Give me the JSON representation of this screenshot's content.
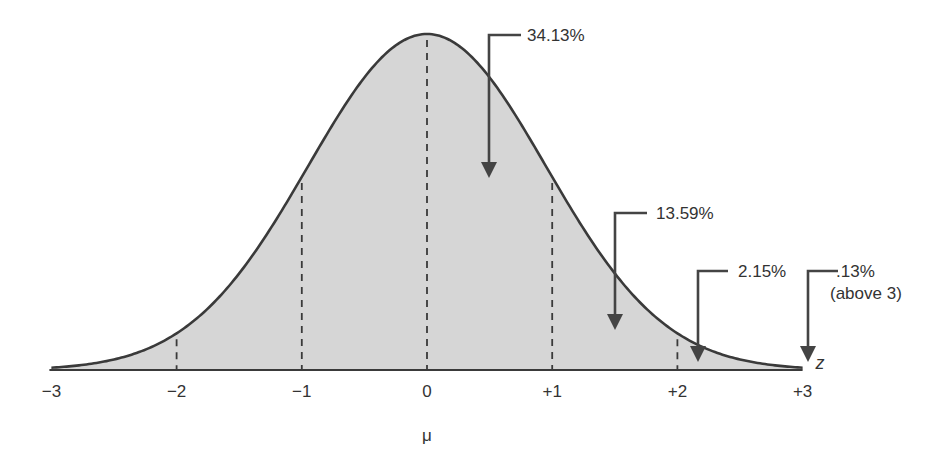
{
  "colors": {
    "fill": "#d6d6d6",
    "line": "#3a3a3a",
    "arrow": "#444444",
    "text": "#333333"
  },
  "chart_data": {
    "type": "area",
    "title": "",
    "xlabel": "z",
    "xlabel_sub": "μ",
    "ylabel": "",
    "xlim": [
      -3,
      3
    ],
    "tick_values": [
      -3,
      -2,
      -1,
      0,
      1,
      2,
      3
    ],
    "tick_labels": [
      "−3",
      "−2",
      "−1",
      "0",
      "+1",
      "+2",
      "+3"
    ],
    "mean_label": "μ",
    "axis_label": "z",
    "dashed_lines_at": [
      -2,
      -1,
      0,
      1,
      2
    ],
    "grid": false,
    "annotations": [
      {
        "label": "34.13%",
        "sublabel": "",
        "region": [
          0,
          1
        ],
        "value": 34.13
      },
      {
        "label": "13.59%",
        "sublabel": "",
        "region": [
          1,
          2
        ],
        "value": 13.59
      },
      {
        "label": "2.15%",
        "sublabel": "",
        "region": [
          2,
          3
        ],
        "value": 2.15
      },
      {
        "label": ".13%",
        "sublabel": "(above 3)",
        "region": [
          3,
          null
        ],
        "value": 0.13
      }
    ]
  },
  "layout": {
    "x0_px": 427,
    "unit_px": 125.2,
    "baseline_px": 370,
    "peak_px": 34,
    "sigma_shape": 0.95
  },
  "arrows": [
    {
      "hx1": 521,
      "hy": 35,
      "vx": 489,
      "tip": 178,
      "tx": 527,
      "ty": 41
    },
    {
      "hx1": 647,
      "hy": 213,
      "vx": 615,
      "tip": 330,
      "tx": 656,
      "ty": 219
    },
    {
      "hx1": 728,
      "hy": 271,
      "vx": 698,
      "tip": 362,
      "tx": 738,
      "ty": 277
    },
    {
      "hx1": 838,
      "hy": 271,
      "vx": 808,
      "tip": 362,
      "tx": 836,
      "ty": 277
    }
  ]
}
